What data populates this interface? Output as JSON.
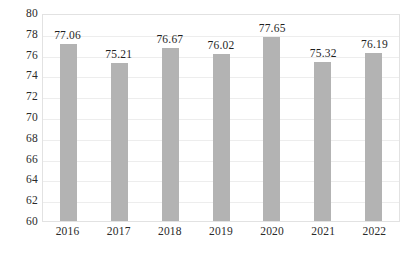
{
  "chart_data": {
    "type": "bar",
    "title": "",
    "subtitle": "",
    "xlabel": "",
    "ylabel": "",
    "categories": [
      "2016",
      "2017",
      "2018",
      "2019",
      "2020",
      "2021",
      "2022"
    ],
    "values": [
      77.06,
      75.21,
      76.67,
      76.02,
      77.65,
      75.32,
      76.19
    ],
    "data_labels": [
      "77.06",
      "75.21",
      "76.67",
      "76.02",
      "77.65",
      "75.32",
      "76.19"
    ],
    "ylim": [
      60,
      80
    ],
    "ytick_step": 2,
    "ytick_labels": [
      "80",
      "78",
      "76",
      "74",
      "72",
      "70",
      "68",
      "66",
      "64",
      "62",
      "60"
    ],
    "grid": true,
    "grid_axis": "y",
    "legend": false,
    "legend_position": "none",
    "series": [
      {
        "name": "",
        "values": [
          77.06,
          75.21,
          76.67,
          76.02,
          77.65,
          75.32,
          76.19
        ]
      }
    ]
  },
  "style": {
    "bar_color": "#b3b3b3",
    "gridline_color": "#ededed",
    "plot_border_color": "#e2e2e2",
    "text_color": "#2a2a2a",
    "background_color": "#ffffff"
  }
}
